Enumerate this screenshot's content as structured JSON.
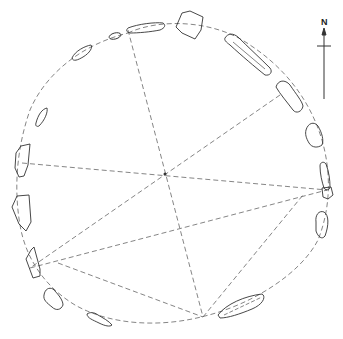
{
  "diagram": {
    "type": "stone circle plan",
    "north_label": "N",
    "colors": {
      "stroke": "#333333",
      "dashed": "#666666",
      "background": "#ffffff"
    },
    "circle_outline": "dashed irregular ring",
    "center_point": [
      165,
      174
    ],
    "stones": [
      {
        "id": 1,
        "position": "north"
      },
      {
        "id": 2,
        "position": "north-northwest small"
      },
      {
        "id": 3,
        "position": "north-northwest tiny"
      },
      {
        "id": 4,
        "position": "northwest"
      },
      {
        "id": 5,
        "position": "west-northwest"
      },
      {
        "id": 6,
        "position": "west"
      },
      {
        "id": 7,
        "position": "west-southwest"
      },
      {
        "id": 8,
        "position": "southwest"
      },
      {
        "id": 9,
        "position": "south-southwest"
      },
      {
        "id": 10,
        "position": "south-west-low"
      },
      {
        "id": 11,
        "position": "south-southeast long"
      },
      {
        "id": 12,
        "position": "east-southeast"
      },
      {
        "id": 13,
        "position": "east"
      },
      {
        "id": 14,
        "position": "east-northeast"
      },
      {
        "id": 15,
        "position": "northeast"
      },
      {
        "id": 16,
        "position": "north-northeast long"
      }
    ],
    "alignment_lines": 6
  }
}
